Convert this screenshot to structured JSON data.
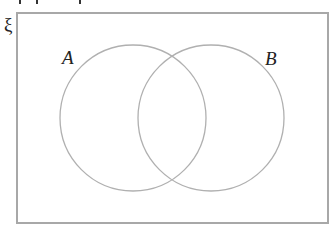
{
  "diagram": {
    "type": "venn",
    "universal_set_label": "ξ",
    "sets": [
      {
        "label": "A",
        "cx": 133,
        "cy": 118,
        "r": 73
      },
      {
        "label": "B",
        "cx": 211,
        "cy": 118,
        "r": 73
      }
    ],
    "frame": {
      "x": 17,
      "y": 13,
      "width": 311,
      "height": 210
    },
    "colors": {
      "stroke": "#b0b0b0",
      "frame": "#a8a8a8",
      "text": "#222222"
    }
  }
}
